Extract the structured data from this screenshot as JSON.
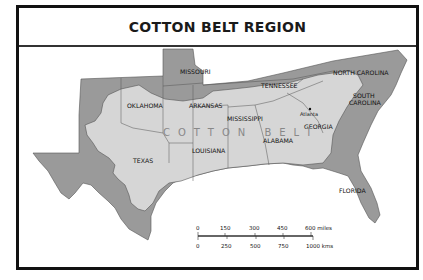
{
  "title": "COTTON BELT REGION",
  "colors": {
    "frame": "#111111",
    "outer_region": "#9a9a9a",
    "cotton_belt": "#d6d6d6",
    "background": "#ffffff",
    "belt_label": "#888888"
  },
  "region_label": "COTTON BELT",
  "states": [
    {
      "name": "MISSOURI"
    },
    {
      "name": "TENNESSEE"
    },
    {
      "name": "NORTH CAROLINA"
    },
    {
      "name": "OKLAHOMA"
    },
    {
      "name": "ARKANSAS"
    },
    {
      "name": "MISSISSIPPI"
    },
    {
      "name": "SOUTH CAROLINA"
    },
    {
      "name": "GEORGIA"
    },
    {
      "name": "ALABAMA"
    },
    {
      "name": "LOUISIANA"
    },
    {
      "name": "TEXAS"
    },
    {
      "name": "FLORIDA"
    }
  ],
  "cities": [
    {
      "name": "Atlanta"
    }
  ],
  "scale": {
    "miles": [
      "0",
      "150",
      "300",
      "450",
      "600 miles"
    ],
    "kms": [
      "0",
      "250",
      "500",
      "750",
      "1000 kms"
    ]
  }
}
